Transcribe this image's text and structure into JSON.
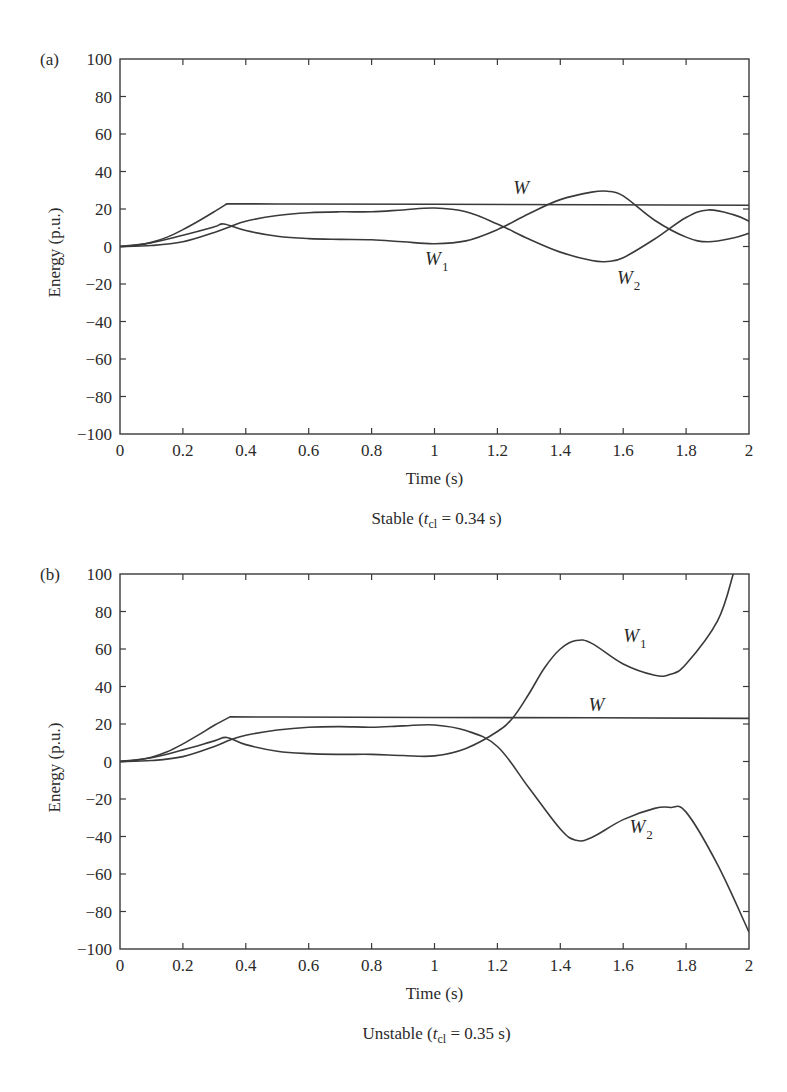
{
  "chart_data": [
    {
      "panel": "(a)",
      "type": "line",
      "caption": {
        "prefix": "Stable (",
        "var": "t",
        "sub": "cl",
        "suffix": " = 0.34 s)"
      },
      "xlabel": "Time (s)",
      "ylabel": "Energy (p.u.)",
      "xlim": [
        0,
        2
      ],
      "ylim": [
        -100,
        100
      ],
      "xticks": [
        0,
        0.2,
        0.4,
        0.6,
        0.8,
        1,
        1.2,
        1.4,
        1.6,
        1.8,
        2
      ],
      "xtick_labels": [
        "0",
        "0.2",
        "0.4",
        "0.6",
        "0.8",
        "1",
        "1.2",
        "1.4",
        "1.6",
        "1.8",
        "2"
      ],
      "yticks": [
        -100,
        -80,
        -60,
        -40,
        -20,
        0,
        20,
        40,
        60,
        80,
        100
      ],
      "ytick_labels": [
        "−100",
        "−80",
        "−60",
        "−40",
        "−20",
        "0",
        "20",
        "40",
        "60",
        "80",
        "100"
      ],
      "grid": false,
      "series": [
        {
          "name": "W",
          "label": {
            "base": "W",
            "sub": "",
            "x": 1.25,
            "y": 28
          },
          "x": [
            0,
            0.05,
            0.1,
            0.15,
            0.2,
            0.25,
            0.3,
            0.34,
            0.5,
            1.0,
            1.5,
            2.0
          ],
          "values": [
            0,
            0.6,
            2.2,
            5.0,
            9.0,
            13.6,
            18.6,
            22.8,
            22.7,
            22.5,
            22.3,
            22.0
          ]
        },
        {
          "name": "W1",
          "label": {
            "base": "W",
            "sub": "1",
            "x": 0.97,
            "y": -10
          },
          "x": [
            0,
            0.1,
            0.2,
            0.3,
            0.33,
            0.4,
            0.5,
            0.6,
            0.7,
            0.8,
            0.9,
            1.0,
            1.1,
            1.2,
            1.3,
            1.4,
            1.5,
            1.55,
            1.6,
            1.7,
            1.8,
            1.87,
            1.95,
            2.0
          ],
          "values": [
            0,
            2.0,
            6.0,
            10.5,
            12.0,
            8.5,
            5.5,
            4.2,
            3.8,
            3.6,
            2.5,
            1.5,
            3.0,
            9.0,
            17.5,
            25.0,
            29.0,
            29.5,
            27.0,
            14.0,
            5.0,
            2.5,
            4.5,
            7.0
          ]
        },
        {
          "name": "W2",
          "label": {
            "base": "W",
            "sub": "2",
            "x": 1.58,
            "y": -20
          },
          "x": [
            0,
            0.1,
            0.2,
            0.3,
            0.35,
            0.4,
            0.5,
            0.6,
            0.7,
            0.8,
            0.9,
            1.0,
            1.1,
            1.2,
            1.3,
            1.4,
            1.5,
            1.55,
            1.6,
            1.7,
            1.8,
            1.87,
            1.95,
            2.0
          ],
          "values": [
            0,
            0.5,
            2.5,
            7.5,
            10.5,
            13.5,
            16.5,
            18.0,
            18.5,
            18.5,
            19.5,
            20.5,
            18.5,
            12.0,
            4.0,
            -3.0,
            -7.5,
            -8.0,
            -6.0,
            4.0,
            15.5,
            19.5,
            17.0,
            13.5
          ]
        }
      ]
    },
    {
      "panel": "(b)",
      "type": "line",
      "caption": {
        "prefix": "Unstable (",
        "var": "t",
        "sub": "cl",
        "suffix": " = 0.35 s)"
      },
      "xlabel": "Time (s)",
      "ylabel": "Energy (p.u.)",
      "xlim": [
        0,
        2
      ],
      "ylim": [
        -100,
        100
      ],
      "xticks": [
        0,
        0.2,
        0.4,
        0.6,
        0.8,
        1,
        1.2,
        1.4,
        1.6,
        1.8,
        2
      ],
      "xtick_labels": [
        "0",
        "0.2",
        "0.4",
        "0.6",
        "0.8",
        "1",
        "1.2",
        "1.4",
        "1.6",
        "1.8",
        "2"
      ],
      "yticks": [
        -100,
        -80,
        -60,
        -40,
        -20,
        0,
        20,
        40,
        60,
        80,
        100
      ],
      "ytick_labels": [
        "−100",
        "−80",
        "−60",
        "−40",
        "−20",
        "0",
        "20",
        "40",
        "60",
        "80",
        "100"
      ],
      "grid": false,
      "series": [
        {
          "name": "W",
          "label": {
            "base": "W",
            "sub": "",
            "x": 1.49,
            "y": 27
          },
          "x": [
            0,
            0.05,
            0.1,
            0.15,
            0.2,
            0.25,
            0.3,
            0.35,
            0.5,
            1.0,
            1.5,
            2.0
          ],
          "values": [
            0,
            0.6,
            2.3,
            5.2,
            9.4,
            14.2,
            19.3,
            23.8,
            23.7,
            23.5,
            23.3,
            23.0
          ]
        },
        {
          "name": "W1",
          "label": {
            "base": "W",
            "sub": "1",
            "x": 1.6,
            "y": 64
          },
          "x": [
            0,
            0.1,
            0.2,
            0.3,
            0.34,
            0.4,
            0.5,
            0.6,
            0.7,
            0.8,
            0.9,
            1.0,
            1.1,
            1.2,
            1.25,
            1.3,
            1.35,
            1.4,
            1.45,
            1.5,
            1.6,
            1.7,
            1.75,
            1.8,
            1.9,
            1.95
          ],
          "values": [
            0,
            2.0,
            6.2,
            11.0,
            12.8,
            9.0,
            5.5,
            4.2,
            3.8,
            3.8,
            3.2,
            3.0,
            7.0,
            16.0,
            23.5,
            36.0,
            50.0,
            60.0,
            64.5,
            63.0,
            52.0,
            46.0,
            46.5,
            52.0,
            75.0,
            100.0
          ]
        },
        {
          "name": "W2",
          "label": {
            "base": "W",
            "sub": "2",
            "x": 1.62,
            "y": -38
          },
          "x": [
            0,
            0.1,
            0.2,
            0.3,
            0.35,
            0.4,
            0.5,
            0.6,
            0.7,
            0.8,
            0.9,
            1.0,
            1.1,
            1.2,
            1.3,
            1.4,
            1.45,
            1.5,
            1.6,
            1.7,
            1.75,
            1.8,
            1.9,
            2.0
          ],
          "values": [
            0,
            0.5,
            2.6,
            8.0,
            11.5,
            14.0,
            16.8,
            18.3,
            18.6,
            18.3,
            19.0,
            19.5,
            16.5,
            8.0,
            -14.0,
            -36.0,
            -42.0,
            -40.5,
            -31.0,
            -25.0,
            -24.5,
            -27.0,
            -55.0,
            -91.0
          ]
        }
      ]
    }
  ]
}
